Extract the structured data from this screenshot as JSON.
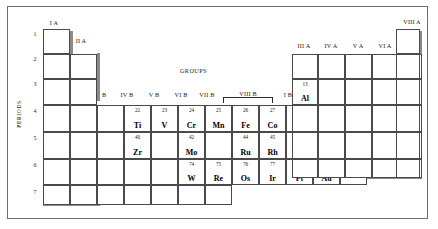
{
  "figure": {
    "title_groups": "GROUPS",
    "title_periods": "PERIODS"
  },
  "periods": [
    "1",
    "2",
    "3",
    "4",
    "5",
    "6",
    "7"
  ],
  "group_labels": {
    "ia": "I A",
    "iia": "II A",
    "iiib": "III B",
    "ivb": "IV B",
    "vb": "V B",
    "vib": "VI B",
    "viib": "VII B",
    "viiib": "VIII B",
    "ib": "I B",
    "iib": "II B",
    "iiia": "III A",
    "iva": "IV A",
    "va": "V A",
    "via": "VI A",
    "viia": "VII A",
    "viiia": "VIII A"
  },
  "elements": [
    {
      "number": "22",
      "symbol": "Ti"
    },
    {
      "number": "23",
      "symbol": "V"
    },
    {
      "number": "24",
      "symbol": "Cr"
    },
    {
      "number": "25",
      "symbol": "Mn"
    },
    {
      "number": "26",
      "symbol": "Fe"
    },
    {
      "number": "27",
      "symbol": "Co"
    },
    {
      "number": "28",
      "symbol": "Ni"
    },
    {
      "number": "29",
      "symbol": "Cu"
    },
    {
      "number": "30",
      "symbol": "Zn"
    },
    {
      "number": "40",
      "symbol": "Zr"
    },
    {
      "number": "42",
      "symbol": "Mo"
    },
    {
      "number": "44",
      "symbol": "Ru"
    },
    {
      "number": "45",
      "symbol": "Rh"
    },
    {
      "number": "46",
      "symbol": "Pd"
    },
    {
      "number": "74",
      "symbol": "W"
    },
    {
      "number": "75",
      "symbol": "Re"
    },
    {
      "number": "76",
      "symbol": "Os"
    },
    {
      "number": "77",
      "symbol": "Ir"
    },
    {
      "number": "78",
      "symbol": "Pt"
    },
    {
      "number": "79",
      "symbol": "Au"
    },
    {
      "number": "13",
      "symbol": "Al"
    }
  ],
  "colors": {
    "frame_border": "#6e6e6e",
    "cell_border": "#4a4a4a",
    "shadow": "#8a8a8a",
    "text": "#000000",
    "background": "#ffffff"
  }
}
